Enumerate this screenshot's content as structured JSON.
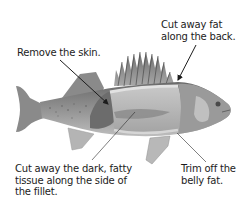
{
  "diagram": {
    "callouts": [
      {
        "id": "back-fat",
        "lines": [
          "Cut away fat",
          "along the back."
        ],
        "pointer": "arrow"
      },
      {
        "id": "skin",
        "lines": [
          "Remove the skin."
        ],
        "pointer": "arrow"
      },
      {
        "id": "side-tissue",
        "lines": [
          "Cut away the dark, fatty",
          "tissue along the side of",
          "the fillet."
        ],
        "pointer": "line"
      },
      {
        "id": "belly-fat",
        "lines": [
          "Trim off the",
          "belly fat."
        ],
        "pointer": "line"
      }
    ]
  },
  "colors": {
    "background": "#ffffff",
    "text": "#1c1c1c",
    "fish_dark": "#5a5a5a",
    "fish_mid": "#8c8c8c",
    "fish_light": "#c4c4c4",
    "fillet_band": "#b8b8b8",
    "fat_line": "#dcdcdc"
  }
}
